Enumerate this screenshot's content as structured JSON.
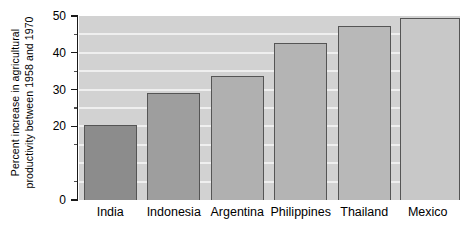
{
  "chart_data": {
    "type": "bar",
    "title": "",
    "xlabel": "",
    "ylabel": "Percent increase in agricultural productivity between 1958 and 1970",
    "ylabel_lines": [
      "Percent increase in agricultural",
      "productivity between 1958 and 1970"
    ],
    "categories": [
      "India",
      "Indonesia",
      "Argentina",
      "Philippines",
      "Thailand",
      "Mexico"
    ],
    "values": [
      20.4,
      29.0,
      33.7,
      42.8,
      47.3,
      49.4
    ],
    "ylim": [
      0,
      50
    ],
    "ytick_labels": [
      "0",
      "20",
      "30",
      "40",
      "50"
    ],
    "yticks_major": [
      0,
      20,
      30,
      40,
      50
    ],
    "yticks_minor": [
      5,
      15,
      25,
      35,
      45
    ],
    "gridlines": [
      5,
      10,
      15,
      20,
      25,
      30,
      35,
      40,
      45
    ],
    "grid": true,
    "legend": "none",
    "bar_colors": [
      "#8c8c8c",
      "#9e9e9e",
      "#b0b0b0",
      "#b4b4b4",
      "#b8b8b8",
      "#c8c8c8"
    ],
    "plot_background": "#d2d2d2",
    "gridline_color": "#efefef",
    "bar_border_color": "#555555",
    "axis_color": "#1a1a1a"
  }
}
